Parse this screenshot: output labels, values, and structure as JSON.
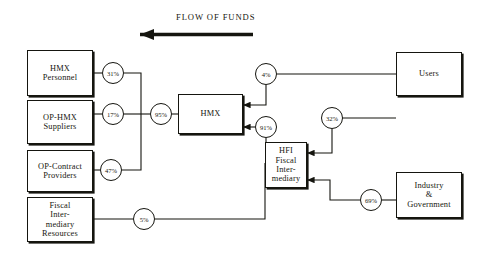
{
  "diagram": {
    "title": "FLOW OF FUNDS",
    "title_arrow_direction": "left",
    "background_color": "#ffffff",
    "line_color": "#15150f",
    "nodes": [
      {
        "id": "hmx-personnel",
        "label": "HMX\nPersonnel"
      },
      {
        "id": "op-hmx-suppliers",
        "label": "OP-HMX\nSuppliers"
      },
      {
        "id": "op-contract-providers",
        "label": "OP-Contract\nProviders"
      },
      {
        "id": "fiscal-intermediary-resources",
        "label": "Fiscal\nInter-\nmediary\nResources"
      },
      {
        "id": "hmx",
        "label": "HMX"
      },
      {
        "id": "hfi",
        "label": "HFI\nFiscal\nInter-\nmediary"
      },
      {
        "id": "users",
        "label": "Users"
      },
      {
        "id": "industry-government",
        "label": "Industry\n&\nGovernment"
      }
    ],
    "percentages": [
      {
        "id": "pct-31",
        "value": "31%"
      },
      {
        "id": "pct-17",
        "value": "17%"
      },
      {
        "id": "pct-47",
        "value": "47%"
      },
      {
        "id": "pct-95",
        "value": "95%"
      },
      {
        "id": "pct-5",
        "value": "5%"
      },
      {
        "id": "pct-4",
        "value": "4%"
      },
      {
        "id": "pct-91",
        "value": "91%"
      },
      {
        "id": "pct-32",
        "value": "32%"
      },
      {
        "id": "pct-69",
        "value": "69%"
      }
    ],
    "flows": [
      {
        "from": "hmx",
        "to": "hmx-personnel",
        "label": "31%"
      },
      {
        "from": "hmx",
        "to": "op-hmx-suppliers",
        "label": "17%"
      },
      {
        "from": "hmx",
        "to": "op-contract-providers",
        "label": "47%"
      },
      {
        "from": "hmx",
        "to": "left-group",
        "label": "95%"
      },
      {
        "from": "users",
        "to": "hmx",
        "label": "4%"
      },
      {
        "from": "hfi",
        "to": "hmx",
        "label": "91%"
      },
      {
        "from": "users",
        "to": "hfi",
        "label": "32%"
      },
      {
        "from": "industry-government",
        "to": "hfi",
        "label": "69%"
      },
      {
        "from": "fiscal-intermediary-resources",
        "to": "hfi",
        "label": "5%"
      }
    ]
  }
}
